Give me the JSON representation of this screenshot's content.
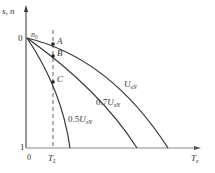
{
  "diagram": {
    "type": "mechanical characteristic curves",
    "axes": {
      "y_label": "s, n",
      "y_top_value": "0",
      "y_top_speed": "n₀",
      "y_bottom_value": "1",
      "x_origin": "0",
      "x_label": "Tₑ",
      "x_label_main": "T",
      "x_label_sub": "e"
    },
    "load_line": {
      "label_main": "T",
      "label_sub": "L"
    },
    "points": [
      {
        "label": "A"
      },
      {
        "label": "B"
      },
      {
        "label": "C"
      }
    ],
    "curves": [
      {
        "label_prefix": "",
        "label_main": "U",
        "label_sub": "sN"
      },
      {
        "label_prefix": "0.7",
        "label_main": "U",
        "label_sub": "sN"
      },
      {
        "label_prefix": "0.5",
        "label_main": "U",
        "label_sub": "sN"
      }
    ],
    "colors": {
      "line": "#333333",
      "background": "#ffffff"
    }
  }
}
